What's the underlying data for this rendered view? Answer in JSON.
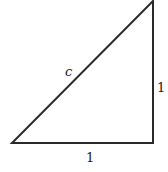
{
  "diagram": {
    "type": "right-triangle",
    "stroke_color": "#2a2a2a",
    "labels": {
      "hypotenuse": "c",
      "vertical_leg": "1",
      "horizontal_leg": "1"
    }
  }
}
